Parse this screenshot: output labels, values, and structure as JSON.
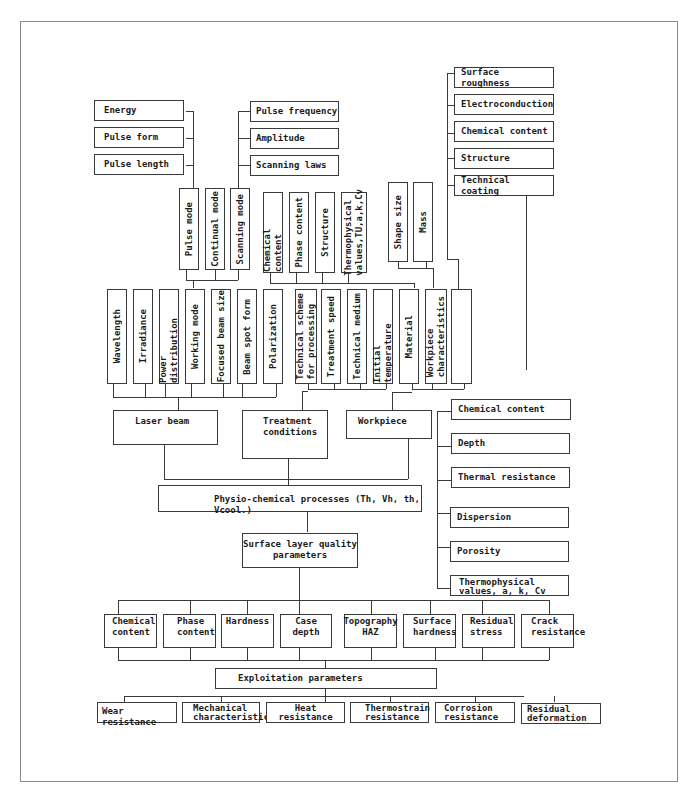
{
  "diagram": {
    "laser_params_top": [
      "Energy",
      "Pulse form",
      "Pulse length"
    ],
    "scan_params_top": [
      "Pulse frequency",
      "Amplitude",
      "Scanning laws"
    ],
    "modes": [
      "Pulse mode",
      "Continual mode",
      "Scanning mode"
    ],
    "medium_params": [
      "Chemical content",
      "Phase content",
      "Structure",
      "Thermophysical\nvalues,TU,a,k,Cv"
    ],
    "workpiece_geom": [
      "Shape size",
      "Mass"
    ],
    "surface_props": [
      "Surface roughness",
      "Electroconduction",
      "Chemical content",
      "Structure",
      "Technical coating"
    ],
    "laser_beam_params": [
      "Wavelength",
      "Irradiance",
      "Power distribution",
      "Working mode",
      "Focused beam size",
      "Beam spot form",
      "Polarization"
    ],
    "treatment_params": [
      "Technical scheme\nfor processing",
      "Treatment speed",
      "Technical medium",
      "Initial temperature"
    ],
    "workpiece_params": [
      "Material",
      "Workpiece\ncharacteristics",
      ""
    ],
    "main_nodes": {
      "laser_beam": "Laser beam",
      "treatment_conditions": "Treatment\nconditions",
      "workpiece": "Workpiece",
      "physio_chemical": "Physio-chemical processes (Th, Vh, th, Vcool.)",
      "surface_layer": "Surface layer quality\nparameters",
      "exploitation": "Exploitation parameters"
    },
    "coating_props": [
      "Chemical content",
      "Depth",
      "Thermal resistance",
      "Dispersion",
      "Porosity",
      "Thermophysical\nvalues, a, k, Cv"
    ],
    "quality_params": [
      "Chemical\ncontent",
      "Phase\ncontent",
      "Hardness",
      "Case depth",
      "Topography\nHAZ",
      "Surface\nhardness",
      "Residual\nstress",
      "Crack\nresistance"
    ],
    "exploitation_params": [
      "Wear resistance",
      "Mechanical\ncharacteristics",
      "Heat\nresistance",
      "Thermostrain\nresistance",
      "Corrosion\nresistance",
      "Residual\ndeformation"
    ]
  }
}
